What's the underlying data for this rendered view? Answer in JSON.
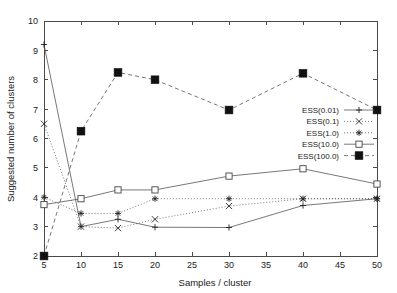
{
  "chart_data": {
    "type": "line",
    "title": "",
    "xlabel": "Samples / cluster",
    "ylabel": "Suggested number of clusters",
    "xlim": [
      5,
      50
    ],
    "ylim": [
      2,
      10
    ],
    "xticks": [
      5,
      10,
      15,
      20,
      25,
      30,
      35,
      40,
      45,
      50
    ],
    "yticks": [
      2,
      3,
      4,
      5,
      6,
      7,
      8,
      9,
      10
    ],
    "xticklabels": [
      "5",
      "10",
      "15",
      "20",
      "25",
      "30",
      "35",
      "40",
      "45",
      "50"
    ],
    "yticklabels": [
      "2",
      "3",
      "4",
      "5",
      "6",
      "7",
      "8",
      "9",
      "10"
    ],
    "grid": false,
    "legend_position": "center-right",
    "x": [
      5,
      10,
      15,
      20,
      30,
      40,
      50
    ],
    "series": [
      {
        "name": "ESS(0.01)",
        "marker": "plus",
        "linestyle": "solid",
        "values": [
          9.2,
          3.0,
          3.25,
          2.98,
          2.97,
          3.72,
          3.95
        ]
      },
      {
        "name": "ESS(0.1)",
        "marker": "cross",
        "linestyle": "dotted",
        "values": [
          6.5,
          3.0,
          2.95,
          3.25,
          3.7,
          3.95,
          3.95
        ]
      },
      {
        "name": "ESS(1.0)",
        "marker": "star",
        "linestyle": "dotted",
        "values": [
          4.0,
          3.45,
          3.45,
          3.95,
          3.95,
          3.95,
          3.95
        ]
      },
      {
        "name": "ESS(10.0)",
        "marker": "open-square",
        "linestyle": "solid",
        "values": [
          3.75,
          3.95,
          4.25,
          4.25,
          4.72,
          4.97,
          4.45
        ]
      },
      {
        "name": "ESS(100.0)",
        "marker": "filled-square",
        "linestyle": "dashed",
        "values": [
          2.0,
          6.25,
          8.25,
          8.0,
          6.97,
          8.22,
          6.97
        ]
      }
    ]
  },
  "legend": {
    "entries": [
      {
        "label": "ESS(0.01)"
      },
      {
        "label": "ESS(0.1)"
      },
      {
        "label": "ESS(1.0)"
      },
      {
        "label": "ESS(10.0)"
      },
      {
        "label": "ESS(100.0)"
      }
    ]
  },
  "colors": {
    "axis": "#4a4a4a",
    "line": "#555555",
    "marker": "#222222",
    "background": "#ffffff"
  }
}
